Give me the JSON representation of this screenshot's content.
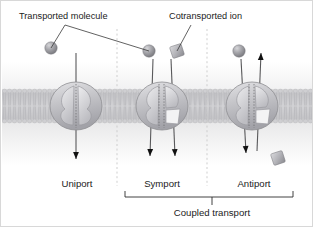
{
  "figure": {
    "background_color": "#ffffff",
    "border_color": "#d8d8d8",
    "width": 313,
    "height": 227
  },
  "callouts": [
    {
      "id": "transported-molecule",
      "label": "Transported molecule",
      "text_x": 18,
      "text_y": 18,
      "leaders": [
        {
          "x1": 64,
          "y1": 24,
          "x2": 50,
          "y2": 47
        },
        {
          "x1": 64,
          "y1": 24,
          "x2": 148,
          "y2": 50
        }
      ]
    },
    {
      "id": "cotransported-ion",
      "label": "Cotransported ion",
      "text_x": 168,
      "text_y": 18,
      "leaders": [
        {
          "x1": 190,
          "y1": 24,
          "x2": 176,
          "y2": 50
        }
      ]
    }
  ],
  "membrane": {
    "top_y": 88,
    "bottom_y": 122,
    "head_color": "#cfcfd2",
    "tail_color": "#bcbcc0",
    "lipid_count": 62
  },
  "dividers": [
    {
      "x": 116,
      "y1": 28,
      "y2": 185
    },
    {
      "x": 206,
      "y1": 28,
      "y2": 185
    }
  ],
  "transporters": [
    {
      "id": "uniport",
      "mode_label": "Uniport",
      "label_x": 76,
      "label_y": 186,
      "center_x": 75,
      "center_y": 105,
      "body_rx": 26,
      "body_ry": 24,
      "cargo": [
        {
          "kind": "sphere",
          "x": 50,
          "y": 47,
          "r": 6.2,
          "color": "#9a9a9e"
        }
      ],
      "flows": [
        {
          "from_x": 75,
          "from_y": 52,
          "to_x": 75,
          "to_y": 158,
          "arrow": "down"
        }
      ]
    },
    {
      "id": "symport",
      "mode_label": "Symport",
      "label_x": 161,
      "label_y": 186,
      "center_x": 161,
      "center_y": 105,
      "body_rx": 26,
      "body_ry": 24,
      "cargo": [
        {
          "kind": "sphere",
          "x": 148,
          "y": 50,
          "r": 6.2,
          "color": "#9a9a9e"
        },
        {
          "kind": "square",
          "x": 176,
          "y": 50,
          "s": 12,
          "color": "#b0b0b4",
          "rotate": -18
        }
      ],
      "flows": [
        {
          "from_x": 152,
          "from_y": 58,
          "to_x": 149,
          "to_y": 155,
          "arrow": "down"
        },
        {
          "from_x": 170,
          "from_y": 58,
          "to_x": 174,
          "to_y": 155,
          "arrow": "down"
        }
      ]
    },
    {
      "id": "antiport",
      "mode_label": "Antiport",
      "label_x": 253,
      "label_y": 186,
      "center_x": 251,
      "center_y": 105,
      "body_rx": 26,
      "body_ry": 24,
      "cargo": [
        {
          "kind": "sphere",
          "x": 238,
          "y": 50,
          "r": 6.2,
          "color": "#9a9a9e"
        },
        {
          "kind": "square",
          "x": 277,
          "y": 157,
          "s": 12,
          "color": "#b0b0b4",
          "rotate": -18
        }
      ],
      "flows": [
        {
          "from_x": 240,
          "from_y": 58,
          "to_x": 245,
          "to_y": 152,
          "arrow": "down"
        },
        {
          "from_x": 256,
          "from_y": 150,
          "to_x": 260,
          "to_y": 52,
          "arrow": "up"
        }
      ]
    }
  ],
  "group": {
    "label": "Coupled transport",
    "label_x": 211,
    "label_y": 215,
    "bracket": {
      "x1": 124,
      "x2": 292,
      "y": 196,
      "tick": 6,
      "stem_x": 211,
      "stem_y2": 204
    }
  }
}
